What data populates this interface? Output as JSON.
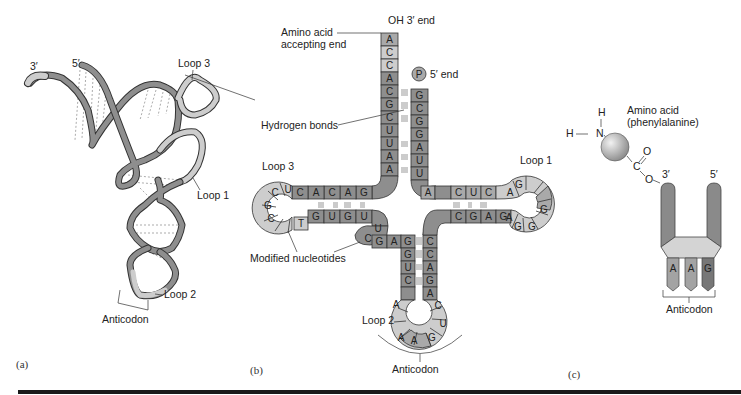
{
  "figure": {
    "panels": [
      "(a)",
      "(b)",
      "(c)"
    ]
  },
  "panel_a": {
    "label": "(a)",
    "end_labels": {
      "three_prime": "3′",
      "five_prime": "5′"
    },
    "loop_labels": {
      "loop1": "Loop 1",
      "loop2": "Loop 2",
      "loop3": "Loop 3"
    },
    "anticodon_label": "Anticodon"
  },
  "panel_b": {
    "label": "(b)",
    "labels": {
      "oh_end": "OH 3′ end",
      "amino_acid_accepting_1": "Amino acid",
      "amino_acid_accepting_2": "accepting end",
      "p_glyph": "P",
      "five_end": "5′ end",
      "hydrogen_bonds": "Hydrogen bonds",
      "loop1": "Loop 1",
      "loop2": "Loop 2",
      "loop3": "Loop 3",
      "modified_nucleotides": "Modified nucleotides",
      "anticodon": "Anticodon"
    },
    "acceptor_stem_3prime": [
      "A",
      "C",
      "C",
      "A",
      "C",
      "G",
      "C",
      "U",
      "U",
      "A",
      "A"
    ],
    "acceptor_stem_5prime": [
      "G",
      "C",
      "G",
      "G",
      "A",
      "U",
      "U"
    ],
    "d_arm_top": [
      "C",
      "A",
      "C",
      "A",
      "G"
    ],
    "d_loop": [
      "U",
      "C",
      "G",
      "C",
      "T"
    ],
    "d_arm_bottom": [
      "G",
      "U",
      "G",
      "U"
    ],
    "connector_left": [
      "U",
      "C"
    ],
    "anticodon_stem_left": [
      "G",
      "A",
      "G",
      "G",
      "U",
      "C"
    ],
    "anticodon_stem_right": [
      "C",
      "C",
      "A",
      "G",
      "A"
    ],
    "anticodon_loop": [
      "A",
      "A",
      "A",
      "G",
      "U",
      "C"
    ],
    "t_arm_top": [
      "A",
      "C",
      "U",
      "C"
    ],
    "t_arm_bottom": [
      "C",
      "G",
      "A",
      "G"
    ],
    "t_loop": [
      "A",
      "G",
      "G",
      "G",
      "G",
      "A"
    ]
  },
  "panel_c": {
    "label": "(c)",
    "amino_acid_1": "Amino acid",
    "amino_acid_2": "(phenylalanine)",
    "atoms": {
      "h": "H",
      "h2": "H",
      "n": "N",
      "c": "C",
      "o_double": "O",
      "o_link": "O"
    },
    "three_prime": "3′",
    "five_prime": "5′",
    "anticodon_bases": [
      "A",
      "A",
      "G"
    ],
    "anticodon_label": "Anticodon"
  }
}
